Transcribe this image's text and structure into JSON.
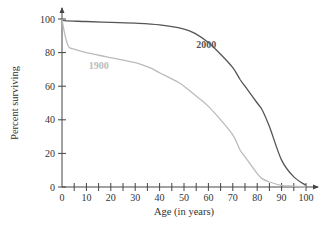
{
  "chart_data": {
    "type": "line",
    "title": "",
    "xlabel": "Age (in years)",
    "ylabel": "Percent surviving",
    "xlim": [
      0,
      100
    ],
    "ylim": [
      0,
      100
    ],
    "xticks": [
      0,
      10,
      20,
      30,
      40,
      50,
      60,
      70,
      80,
      90,
      100
    ],
    "xminor_step": 5,
    "yticks": [
      0,
      20,
      40,
      60,
      80,
      100
    ],
    "grid": false,
    "legend": "inline labels",
    "series": [
      {
        "name": "2000",
        "color": "#555555",
        "label_at": [
          55,
          83
        ],
        "x": [
          0,
          1,
          10,
          20,
          30,
          40,
          50,
          55,
          60,
          65,
          70,
          73,
          75,
          80,
          82,
          85,
          90,
          95,
          100
        ],
        "y": [
          100,
          99,
          98.5,
          98,
          97.5,
          96.5,
          94,
          91,
          86,
          79,
          71,
          64,
          60,
          50,
          46,
          36,
          16,
          6,
          1
        ]
      },
      {
        "name": "1900",
        "color": "#bbbbbb",
        "label_at": [
          11,
          70
        ],
        "x": [
          0,
          1,
          2,
          3,
          5,
          10,
          20,
          30,
          36,
          40,
          48,
          50,
          56,
          60,
          65,
          70,
          73,
          75,
          80,
          82,
          85,
          90,
          95,
          100
        ],
        "y": [
          100,
          92,
          86,
          83,
          82,
          80,
          77,
          74,
          71,
          68,
          62,
          60,
          53,
          48,
          40,
          31,
          22,
          18,
          8,
          5,
          3,
          1,
          0.5,
          0
        ]
      }
    ]
  }
}
